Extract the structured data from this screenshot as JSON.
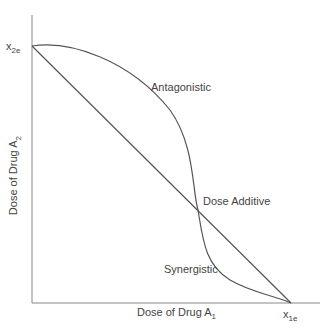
{
  "diagram": {
    "type": "isobologram",
    "x_axis": {
      "label": "Dose of Drug A",
      "label_sub": "1",
      "intercept_label": "x",
      "intercept_sub": "1e"
    },
    "y_axis": {
      "label": "Dose of Drug A",
      "label_sub": "2",
      "intercept_label": "x",
      "intercept_sub": "2e"
    },
    "curves": [
      {
        "name": "Antagonistic",
        "label": "Antagonistic"
      },
      {
        "name": "Dose Additive",
        "label": "Dose Additive"
      },
      {
        "name": "Synergistic",
        "label": "Synergistic"
      }
    ],
    "colors": {
      "line": "#555555",
      "axis": "#888888",
      "text": "#444444"
    }
  }
}
